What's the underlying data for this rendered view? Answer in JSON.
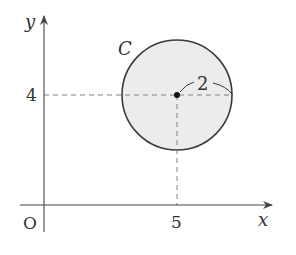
{
  "diagram": {
    "axes": {
      "x_label": "x",
      "y_label": "y",
      "origin_label": "O"
    },
    "circle": {
      "name": "C",
      "center": [
        5,
        4
      ],
      "radius": 2,
      "radius_label": "2",
      "fill": "#ececec",
      "stroke": "#3a3a3a"
    },
    "ticks": {
      "x_tick_label": "5",
      "y_tick_label": "4"
    },
    "colors": {
      "axis": "#444444",
      "dashed": "#777777",
      "text": "#333333"
    }
  }
}
